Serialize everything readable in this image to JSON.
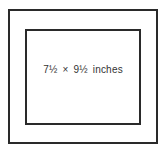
{
  "diagram": {
    "outer_frame": {
      "stroke": "#2a2a2a"
    },
    "inner_frame": {
      "stroke": "#2a2a2a"
    },
    "label": "7½ × 9½ inches"
  }
}
